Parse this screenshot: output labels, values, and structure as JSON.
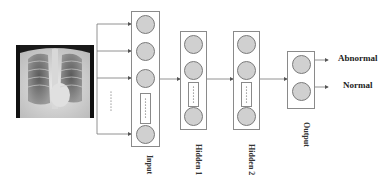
{
  "diagram": {
    "type": "neural-network-architecture",
    "input_image": "chest-xray",
    "layers": [
      {
        "name": "input",
        "label": "Input",
        "visible_nodes": 4,
        "has_ellipsis": true
      },
      {
        "name": "hidden1",
        "label": "Hidden 1",
        "visible_nodes": 3,
        "has_ellipsis": true
      },
      {
        "name": "hidden2",
        "label": "Hidden 2",
        "visible_nodes": 3,
        "has_ellipsis": true
      },
      {
        "name": "output",
        "label": "Output",
        "visible_nodes": 2,
        "has_ellipsis": false
      }
    ],
    "outputs": [
      {
        "label": "Abnormal"
      },
      {
        "label": "Normal"
      }
    ],
    "colors": {
      "node_fill": "#d0d0d0",
      "node_stroke": "#7a7a7a",
      "box_stroke": "#8a8a8a",
      "arrow": "#666666"
    }
  }
}
